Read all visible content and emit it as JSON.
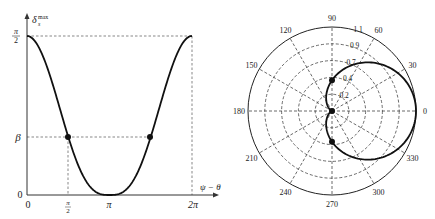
{
  "chart_data": [
    {
      "type": "line",
      "title": "",
      "xlabel": "ψ − θ",
      "ylabel": "δ_s^max",
      "x_ticks": [
        "0",
        "π/2",
        "π",
        "2π"
      ],
      "y_ticks": [
        "0",
        "β",
        "π/2"
      ],
      "xlim": [
        0,
        6.2832
      ],
      "ylim": [
        0,
        1.5708
      ],
      "grid": false,
      "series": [
        {
          "name": "δ_s^max(ψ−θ)",
          "x": [
            0,
            0.785,
            1.571,
            2.356,
            2.8,
            3.1416,
            3.48,
            3.927,
            4.712,
            5.498,
            6.2832
          ],
          "values": [
            1.5708,
            1.27,
            0.573,
            0.11,
            0.01,
            0,
            0.01,
            0.11,
            0.573,
            1.27,
            1.5708
          ]
        }
      ],
      "markers": [
        {
          "x": 1.5708,
          "y": 0.573,
          "label": "β"
        },
        {
          "x": 4.7124,
          "y": 0.573,
          "label": "β"
        }
      ],
      "guides": [
        "dashed horizontal at π/2",
        "dashed horizontal at β",
        "dashed vertical at π/2",
        "dashed vertical at 2π"
      ]
    },
    {
      "type": "polar",
      "title": "",
      "angle_ticks": [
        "0",
        "30",
        "60",
        "90",
        "120",
        "150",
        "180",
        "210",
        "240",
        "270",
        "300",
        "330"
      ],
      "radial_ticks": [
        "0.2",
        "0.4",
        "0.7",
        "0.9",
        "1.1"
      ],
      "rlim": [
        0,
        1.1
      ],
      "grid": true,
      "series": [
        {
          "name": "normalized δ_s^max",
          "theta_deg": [
            0,
            30,
            60,
            90,
            120,
            150,
            180,
            210,
            240,
            270,
            300,
            330,
            360
          ],
          "r": [
            1.1,
            0.97,
            0.7,
            0.4,
            0.14,
            0.02,
            0,
            0.02,
            0.14,
            0.4,
            0.7,
            0.97,
            1.1
          ]
        }
      ],
      "markers": [
        {
          "theta_deg": 90,
          "r": 0.4
        },
        {
          "theta_deg": 0,
          "r": 0
        },
        {
          "theta_deg": 270,
          "r": 0.4
        }
      ]
    }
  ],
  "left": {
    "y_top_num": "π",
    "y_top_den": "2",
    "y_beta": "β",
    "y_zero": "0",
    "x_zero": "0",
    "x_half_num": "π",
    "x_half_den": "2",
    "x_pi": "π",
    "x_2pi": "2π",
    "x_axis_label": "ψ − θ",
    "y_axis_label": "δ",
    "y_axis_sub": "s",
    "y_axis_sup": "max"
  },
  "polar": {
    "angles": [
      {
        "deg": 0,
        "label": "0"
      },
      {
        "deg": 30,
        "label": "30"
      },
      {
        "deg": 60,
        "label": "60"
      },
      {
        "deg": 90,
        "label": "90"
      },
      {
        "deg": 120,
        "label": "120"
      },
      {
        "deg": 150,
        "label": "150"
      },
      {
        "deg": 180,
        "label": "180"
      },
      {
        "deg": 210,
        "label": "210"
      },
      {
        "deg": 240,
        "label": "240"
      },
      {
        "deg": 270,
        "label": "270"
      },
      {
        "deg": 300,
        "label": "300"
      },
      {
        "deg": 330,
        "label": "330"
      }
    ],
    "rings": [
      "0.2",
      "0.4",
      "0.7",
      "0.9",
      "1.1"
    ]
  },
  "colors": {
    "curve": "#111111",
    "axis": "#333333",
    "grid": "#444444"
  }
}
